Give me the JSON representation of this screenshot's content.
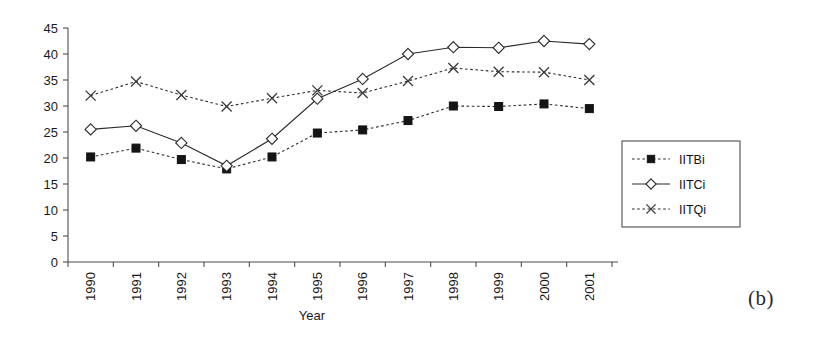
{
  "figure": {
    "panel_label": "(b)",
    "background_color": "#ffffff",
    "ink_color": "#2b2b2b"
  },
  "chart_data": {
    "type": "line",
    "title": "",
    "xlabel": "Year",
    "ylabel": "",
    "categories": [
      "1990",
      "1991",
      "1992",
      "1993",
      "1994",
      "1995",
      "1996",
      "1997",
      "1998",
      "1999",
      "2000",
      "2001"
    ],
    "x": [
      1990,
      1991,
      1992,
      1993,
      1994,
      1995,
      1996,
      1997,
      1998,
      1999,
      2000,
      2001
    ],
    "series": [
      {
        "name": "IITBi",
        "marker": "filled-square",
        "linestyle": "dashed",
        "color": "#141414",
        "values": [
          20.2,
          21.9,
          19.7,
          17.9,
          20.2,
          24.8,
          25.4,
          27.2,
          30.0,
          29.9,
          30.4,
          29.5
        ]
      },
      {
        "name": "IITCi",
        "marker": "open-diamond",
        "linestyle": "solid",
        "color": "#2b2b2b",
        "values": [
          25.5,
          26.2,
          22.9,
          18.5,
          23.7,
          31.4,
          35.2,
          40.0,
          41.3,
          41.2,
          42.5,
          41.9
        ]
      },
      {
        "name": "IITQi",
        "marker": "cross",
        "linestyle": "dashed",
        "color": "#3a3a3a",
        "values": [
          32.0,
          34.7,
          32.1,
          29.9,
          31.5,
          33.0,
          32.5,
          34.8,
          37.3,
          36.6,
          36.5,
          35.0
        ]
      }
    ],
    "ylim": [
      0,
      45
    ],
    "yticks": [
      0,
      5,
      10,
      15,
      20,
      25,
      30,
      35,
      40,
      45
    ],
    "ytick_labels": [
      "0",
      "5",
      "10",
      "15",
      "20",
      "25",
      "30",
      "35",
      "40",
      "45"
    ],
    "xtick_rotation": 90,
    "grid": false,
    "legend_position": "right",
    "legend_entries": [
      "IITBi",
      "IITCi",
      "IITQi"
    ]
  }
}
